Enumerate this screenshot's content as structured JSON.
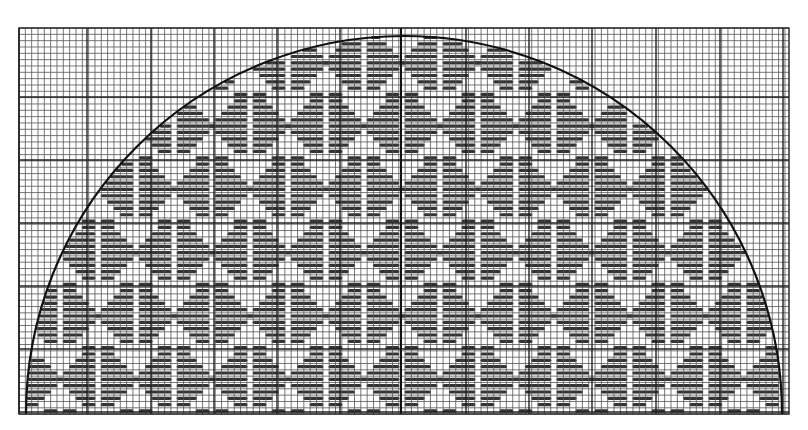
{
  "diagram": {
    "type": "needlepoint-chart",
    "canvas": {
      "width": 808,
      "height": 430,
      "background": "#ffffff"
    },
    "grid": {
      "left": 19,
      "top": 28,
      "right": 789,
      "bottom": 414,
      "cell": 6.33,
      "major_every": 10,
      "major_x": [
        19,
        87,
        151,
        214,
        277,
        340,
        401,
        466,
        529,
        592,
        656,
        720,
        783
      ],
      "major_y": [
        97,
        160,
        223,
        286,
        349,
        412
      ],
      "minor_color": "#555555",
      "major_color": "#222222"
    },
    "arc": {
      "center_x": 404,
      "center_y": 414,
      "radius": 378,
      "color": "#111111",
      "stroke_width": 2.2
    },
    "center_line": {
      "x": 401,
      "color": "#111111",
      "stroke_width": 2
    },
    "stitch": {
      "color": "#333333",
      "thickness": 3.2,
      "motif_width_cells": 12,
      "motif_height_cells": 10,
      "row_step": 2
    }
  }
}
